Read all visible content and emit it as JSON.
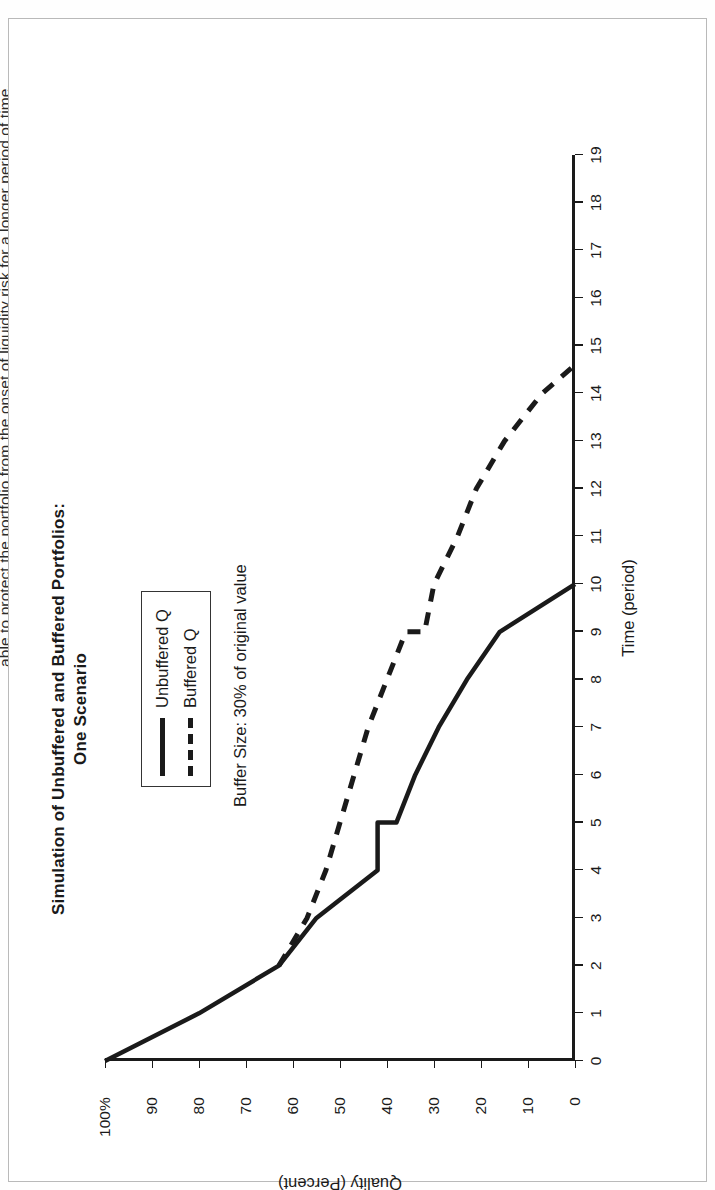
{
  "page": {
    "caption": "able to protect the portfolio from the onset of liquidity risk for a longer period of time.",
    "background_color": "#ffffff",
    "frame_color": "#b9b9b9"
  },
  "figure": {
    "title_line1": "Simulation of Unbuffered and Buffered Portfolios:",
    "title_line2": "One Scenario",
    "note": "Buffer Size:  30% of original value",
    "ink_color": "#1a1a1a"
  },
  "chart_data": {
    "type": "line",
    "title": "Simulation of Unbuffered and Buffered Portfolios: One Scenario",
    "xlabel": "Time (period)",
    "ylabel": "Quality (Percent)",
    "xlim": [
      0,
      19
    ],
    "ylim": [
      0,
      100
    ],
    "grid": false,
    "legend_position": "top-right",
    "xticks": [
      0,
      1,
      2,
      3,
      4,
      5,
      6,
      7,
      8,
      9,
      10,
      11,
      12,
      13,
      14,
      15,
      16,
      17,
      18,
      19
    ],
    "xticklabels": [
      "0",
      "1",
      "2",
      "3",
      "4",
      "5",
      "6",
      "7",
      "8",
      "9",
      "10",
      "11",
      "12",
      "13",
      "14",
      "15",
      "16",
      "17",
      "18",
      "19"
    ],
    "yticks": [
      0,
      10,
      20,
      30,
      40,
      50,
      60,
      70,
      80,
      90,
      100
    ],
    "yticklabels": [
      "0",
      "10",
      "20",
      "30",
      "40",
      "50",
      "60",
      "70",
      "80",
      "90",
      "100%"
    ],
    "annotations": [
      "Buffer Size:  30% of original value"
    ],
    "series": [
      {
        "name": "Unbuffered Q",
        "style": "solid",
        "color": "#1a1a1a",
        "x": [
          0,
          1,
          2,
          3,
          4,
          5,
          5,
          6,
          7,
          8,
          9,
          10,
          10
        ],
        "values": [
          100,
          80,
          63,
          55,
          42,
          42,
          38,
          34,
          29,
          23,
          16,
          0,
          0
        ]
      },
      {
        "name": "Buffered Q",
        "style": "dashed",
        "color": "#1a1a1a",
        "x": [
          2,
          3,
          4,
          5,
          6,
          7,
          8,
          9,
          9,
          10,
          11,
          12,
          13,
          14,
          14.6
        ],
        "values": [
          63,
          57,
          53,
          50,
          47,
          44,
          40,
          36,
          32,
          30,
          25,
          21,
          15,
          7,
          0
        ]
      }
    ]
  },
  "legend": {
    "items": [
      {
        "label": "Unbuffered Q",
        "style": "solid"
      },
      {
        "label": "Buffered Q",
        "style": "dashed"
      }
    ]
  }
}
